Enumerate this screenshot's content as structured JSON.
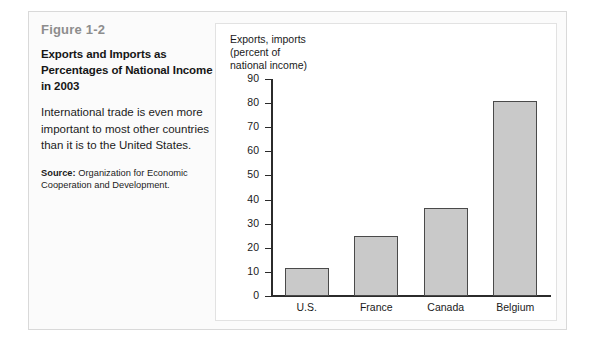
{
  "figure": {
    "number": "Figure 1-2",
    "title": "Exports and Imports as Percentages of National Income in 2003",
    "description": "International trade is even more important to most other countries than it is to the United States.",
    "source_label": "Source:",
    "source_text": " Organization for Economic Cooperation and Development."
  },
  "chart_data": {
    "type": "bar",
    "title": "",
    "axis_note": "Exports, imports\n(percent of\nnational income)",
    "categories": [
      "U.S.",
      "France",
      "Canada",
      "Belgium"
    ],
    "values": [
      11.5,
      25,
      36.5,
      81
    ],
    "xlabel": "",
    "ylabel": "Exports, imports (percent of national income)",
    "ylim": [
      0,
      90
    ],
    "yticks": [
      0,
      10,
      20,
      30,
      40,
      50,
      60,
      70,
      80,
      90
    ],
    "ytick_labels": [
      "0",
      "10",
      "20",
      "30",
      "40",
      "50",
      "60",
      "70",
      "80",
      "90"
    ],
    "grid": false,
    "legend": false,
    "bar_fill_color": "#c9c9c9",
    "bar_border_color": "#4a4a4a"
  }
}
